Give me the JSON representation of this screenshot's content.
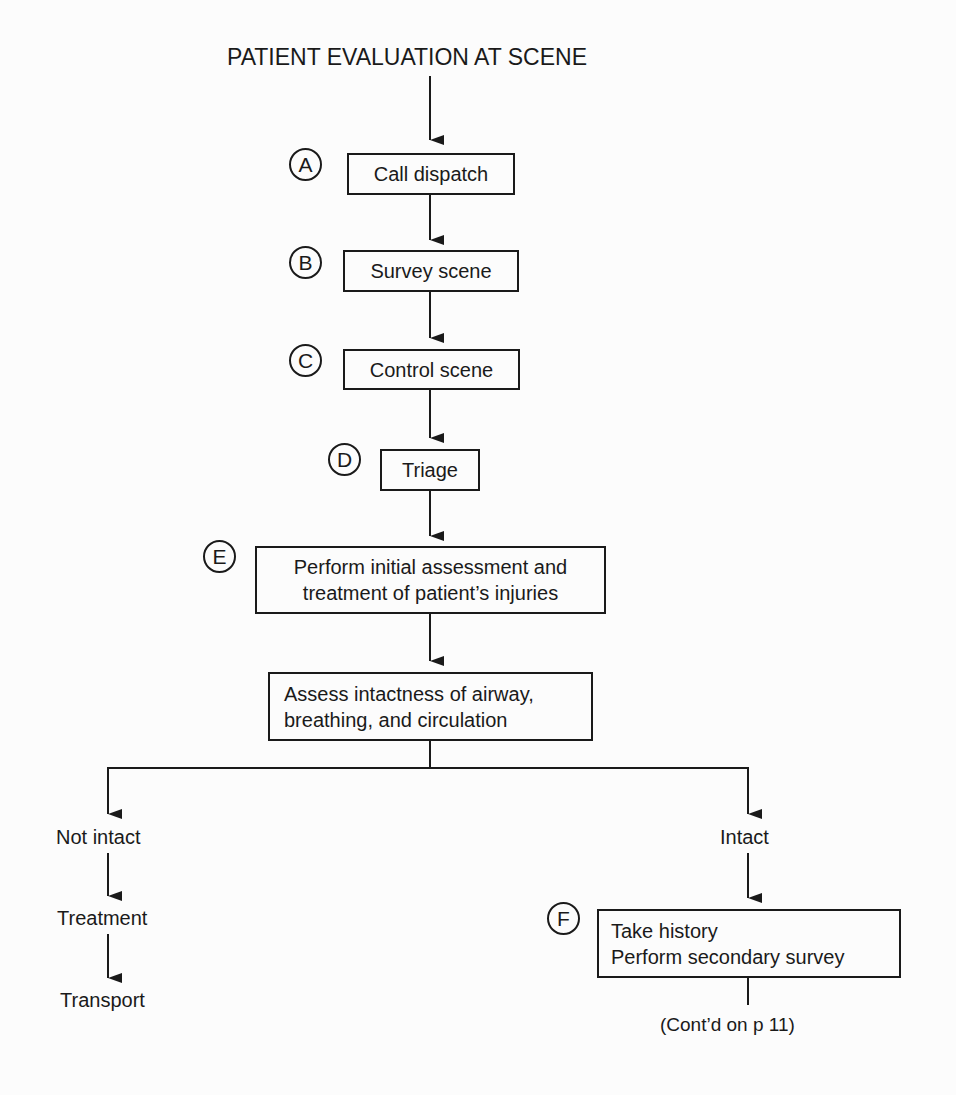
{
  "title": "PATIENT EVALUATION AT SCENE",
  "steps": [
    {
      "marker": "A",
      "lines": [
        "Call dispatch"
      ]
    },
    {
      "marker": "B",
      "lines": [
        "Survey scene"
      ]
    },
    {
      "marker": "C",
      "lines": [
        "Control scene"
      ]
    },
    {
      "marker": "D",
      "lines": [
        "Triage"
      ]
    },
    {
      "marker": "E",
      "lines": [
        "Perform initial assessment and",
        "treatment of patient’s injuries"
      ]
    },
    {
      "marker": "",
      "lines": [
        "Assess intactness of airway,",
        "breathing, and circulation"
      ]
    }
  ],
  "branches": {
    "left": {
      "items": [
        "Not intact",
        "Treatment",
        "Transport"
      ]
    },
    "right": {
      "label": "Intact",
      "step": {
        "marker": "F",
        "lines": [
          "Take history",
          "Perform secondary survey"
        ]
      },
      "continuation": "(Cont’d on p 11)"
    }
  }
}
